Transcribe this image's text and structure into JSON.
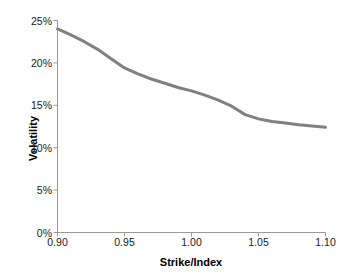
{
  "chart_data": {
    "type": "line",
    "title": "",
    "xlabel": "Strike/Index",
    "ylabel": "Volatility",
    "xlim": [
      0.9,
      1.1
    ],
    "ylim": [
      0,
      25
    ],
    "grid": false,
    "legend": "none",
    "x_tick_labels": [
      "0.90",
      "0.95",
      "1.00",
      "1.05",
      "1.10"
    ],
    "x_tick_values": [
      0.9,
      0.95,
      1.0,
      1.05,
      1.1
    ],
    "y_tick_labels": [
      "0%",
      "5%",
      "10%",
      "15%",
      "20%",
      "25%"
    ],
    "y_tick_values": [
      0,
      5,
      10,
      15,
      20,
      25
    ],
    "series": [
      {
        "name": "Implied volatility skew",
        "color": "#808080",
        "line_width": 3,
        "x": [
          0.9,
          0.91,
          0.92,
          0.93,
          0.94,
          0.95,
          0.96,
          0.97,
          0.98,
          0.99,
          1.0,
          1.01,
          1.02,
          1.03,
          1.04,
          1.05,
          1.06,
          1.07,
          1.08,
          1.09,
          1.1
        ],
        "values": [
          24.0,
          23.3,
          22.5,
          21.6,
          20.5,
          19.4,
          18.7,
          18.1,
          17.6,
          17.1,
          16.7,
          16.2,
          15.6,
          14.9,
          13.9,
          13.4,
          13.1,
          12.9,
          12.7,
          12.55,
          12.4
        ]
      }
    ]
  },
  "axes": {
    "x_title": "Strike/Index",
    "y_title": "Volatility"
  }
}
